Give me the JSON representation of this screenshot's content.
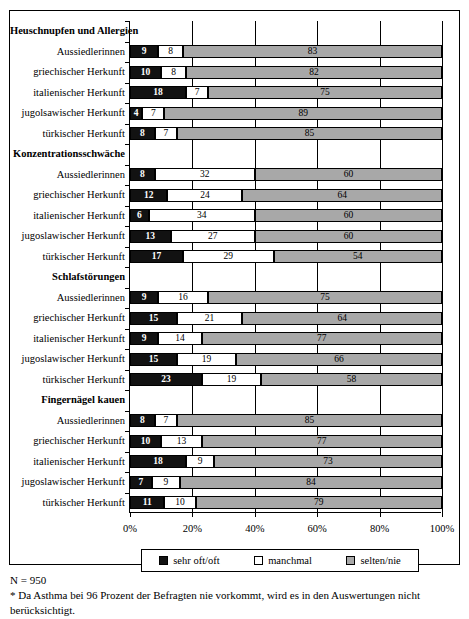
{
  "chart_data": {
    "type": "bar",
    "subtype": "stacked-horizontal-100pct",
    "title": "",
    "xlabel": "",
    "ylabel": "",
    "xlim": [
      0,
      100
    ],
    "xticks": [
      0,
      20,
      40,
      60,
      80,
      100
    ],
    "xticklabels": [
      "0%",
      "20%",
      "40%",
      "60%",
      "80%",
      "100%"
    ],
    "grid": true,
    "legend_position": "bottom",
    "series_names": [
      "sehr oft/oft",
      "manchmal",
      "selten/nie"
    ],
    "series_colors": [
      "#121212",
      "#ffffff",
      "#a8a8a8"
    ],
    "groups": [
      {
        "header": "Heuschnupfen und Allergien",
        "rows": [
          {
            "label": "Aussiedlerinnen",
            "values": [
              9,
              8,
              83
            ]
          },
          {
            "label": "griechischer Herkunft",
            "values": [
              10,
              8,
              82
            ]
          },
          {
            "label": "italienischer Herkunft",
            "values": [
              18,
              7,
              75
            ]
          },
          {
            "label": "jugolsawischer Herkunft",
            "values": [
              4,
              7,
              89
            ]
          },
          {
            "label": "türkischer Herkunft",
            "values": [
              8,
              7,
              85
            ]
          }
        ]
      },
      {
        "header": "Konzentrationsschwäche",
        "rows": [
          {
            "label": "Aussiedlerinnen",
            "values": [
              8,
              32,
              60
            ]
          },
          {
            "label": "griechischer Herkunft",
            "values": [
              12,
              24,
              64
            ]
          },
          {
            "label": "italienischer Herkunft",
            "values": [
              6,
              34,
              60
            ]
          },
          {
            "label": "jugoslawischer Herkunft",
            "values": [
              13,
              27,
              60
            ]
          },
          {
            "label": "türkischer Herkunft",
            "values": [
              17,
              29,
              54
            ]
          }
        ]
      },
      {
        "header": "Schlafstörungen",
        "rows": [
          {
            "label": "Aussiedlerinnen",
            "values": [
              9,
              16,
              75
            ]
          },
          {
            "label": "griechischer Herkunft",
            "values": [
              15,
              21,
              64
            ]
          },
          {
            "label": "italienischer Herkunft",
            "values": [
              9,
              14,
              77
            ]
          },
          {
            "label": "jugoslawischer Herkunft",
            "values": [
              15,
              19,
              66
            ]
          },
          {
            "label": "türkischer Herkunft",
            "values": [
              23,
              19,
              58
            ]
          }
        ]
      },
      {
        "header": "Fingernägel kauen",
        "rows": [
          {
            "label": "Aussiedlerinnen",
            "values": [
              8,
              7,
              85
            ]
          },
          {
            "label": "griechischer Herkunft",
            "values": [
              10,
              13,
              77
            ]
          },
          {
            "label": "italienischer Herkunft",
            "values": [
              18,
              9,
              73
            ]
          },
          {
            "label": "jugoslawischer Herkunft",
            "values": [
              7,
              9,
              84
            ]
          },
          {
            "label": "türkischer Herkunft",
            "values": [
              11,
              10,
              79
            ]
          }
        ]
      }
    ]
  },
  "footnote": {
    "line1": "N = 950",
    "line2": "* Da Asthma bei 96 Prozent der Befragten nie vorkommt, wird es in den Auswertungen nicht",
    "line3": "berücksichtigt."
  }
}
